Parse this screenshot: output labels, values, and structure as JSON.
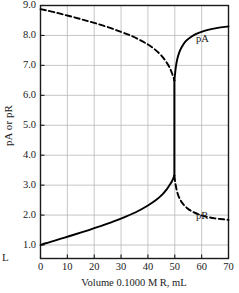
{
  "margin_glyph": "L",
  "chart_data": {
    "type": "line",
    "title": "",
    "xlabel": "Volume 0.1000 M R, mL",
    "ylabel": "pA or pR",
    "xlim": [
      0,
      70
    ],
    "ylim": [
      0.55,
      9.0
    ],
    "xticks": [
      0,
      10,
      20,
      30,
      40,
      50,
      60,
      70
    ],
    "xtick_labels": [
      "0",
      "10",
      "20",
      "30",
      "40",
      "50",
      "60",
      "70"
    ],
    "yticks": [
      1.0,
      2.0,
      3.0,
      4.0,
      5.0,
      6.0,
      7.0,
      8.0,
      9.0
    ],
    "ytick_labels": [
      "1.0",
      "2.0",
      "3.0",
      "4.0",
      "5.0",
      "6.0",
      "7.0",
      "8.0",
      "9.0"
    ],
    "grid": true,
    "grid_color": "#b8b8b8",
    "axis_color": "#1a1a1a",
    "curve_color": "#000000",
    "equivalence_point": 50.0,
    "legend_position": "inline-annotation",
    "annotations": [
      {
        "text": "pA",
        "x": 63.5,
        "y": 7.85
      },
      {
        "text": "pR",
        "x": 63.5,
        "y": 1.95
      }
    ],
    "series": [
      {
        "name": "pA",
        "style": "dashed",
        "segment": "pre-equivalence",
        "x": [
          0,
          2,
          5,
          8,
          12,
          16,
          20,
          25,
          30,
          34,
          38,
          41,
          44,
          46,
          47.5,
          48.5,
          49.2,
          49.6,
          49.85
        ],
        "y": [
          8.88,
          8.84,
          8.78,
          8.71,
          8.62,
          8.52,
          8.42,
          8.28,
          8.12,
          7.98,
          7.8,
          7.64,
          7.42,
          7.22,
          7.02,
          6.84,
          6.68,
          6.58,
          6.5
        ]
      },
      {
        "name": "pA",
        "style": "solid",
        "segment": "post-equivalence",
        "x": [
          49.85,
          50.1,
          50.4,
          50.9,
          51.6,
          52.5,
          54,
          56,
          58,
          61,
          64,
          67,
          70
        ],
        "y": [
          6.5,
          6.72,
          6.95,
          7.2,
          7.42,
          7.6,
          7.8,
          7.95,
          8.05,
          8.15,
          8.22,
          8.27,
          8.3
        ]
      },
      {
        "name": "pR",
        "style": "solid",
        "segment": "pre-equivalence",
        "x": [
          0,
          2,
          5,
          9,
          13,
          18,
          22,
          27,
          32,
          36,
          40,
          43,
          45.5,
          47,
          48.2,
          49,
          49.5,
          49.85
        ],
        "y": [
          1.0,
          1.06,
          1.14,
          1.25,
          1.36,
          1.5,
          1.62,
          1.78,
          1.96,
          2.12,
          2.32,
          2.5,
          2.7,
          2.86,
          3.02,
          3.14,
          3.24,
          3.32
        ]
      },
      {
        "name": "pR",
        "style": "dashed",
        "segment": "post-equivalence",
        "x": [
          49.85,
          50.2,
          50.6,
          51.2,
          52,
          53,
          54.5,
          56.5,
          59,
          62,
          65,
          68,
          70
        ],
        "y": [
          3.32,
          3.08,
          2.88,
          2.68,
          2.52,
          2.38,
          2.24,
          2.12,
          2.02,
          1.94,
          1.89,
          1.86,
          1.84
        ]
      },
      {
        "name": "equivalence-jump",
        "style": "solid",
        "segment": "vertical",
        "x": [
          49.85,
          49.85
        ],
        "y": [
          3.32,
          6.5
        ]
      }
    ]
  }
}
